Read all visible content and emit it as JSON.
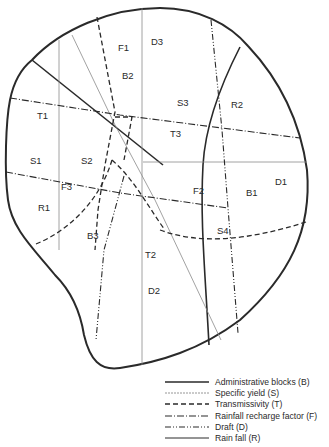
{
  "diagram": {
    "type": "thematic overlay map",
    "colors": {
      "line": "#2a2a2a",
      "thin_line": "#8a8a8a",
      "background": "#ffffff"
    },
    "zone_labels": [
      {
        "id": "F1",
        "x": 118,
        "y": 51
      },
      {
        "id": "D3",
        "x": 151,
        "y": 45
      },
      {
        "id": "B2",
        "x": 122,
        "y": 79
      },
      {
        "id": "S3",
        "x": 177,
        "y": 106
      },
      {
        "id": "R2",
        "x": 231,
        "y": 108
      },
      {
        "id": "T1",
        "x": 37,
        "y": 119
      },
      {
        "id": "T3",
        "x": 170,
        "y": 137
      },
      {
        "id": "S1",
        "x": 30,
        "y": 164
      },
      {
        "id": "S2",
        "x": 81,
        "y": 164
      },
      {
        "id": "F3",
        "x": 61,
        "y": 190
      },
      {
        "id": "F2",
        "x": 193,
        "y": 194
      },
      {
        "id": "B1",
        "x": 246,
        "y": 196
      },
      {
        "id": "D1",
        "x": 275,
        "y": 185
      },
      {
        "id": "R1",
        "x": 38,
        "y": 211
      },
      {
        "id": "S4",
        "x": 217,
        "y": 234
      },
      {
        "id": "B3",
        "x": 87,
        "y": 239
      },
      {
        "id": "T2",
        "x": 145,
        "y": 258
      },
      {
        "id": "D2",
        "x": 148,
        "y": 294
      }
    ]
  },
  "legend": {
    "items": [
      {
        "label": "Administrative blocks (B)",
        "style": "solid-thick"
      },
      {
        "label": "Specific yield (S)",
        "style": "dotted-thin"
      },
      {
        "label": "Transmissivity (T)",
        "style": "dashed"
      },
      {
        "label": "Rainfall recharge factor (F)",
        "style": "dash-dot"
      },
      {
        "label": "Draft (D)",
        "style": "dash-dot-dot"
      },
      {
        "label": "Rain fall (R)",
        "style": "solid-thin"
      }
    ]
  }
}
